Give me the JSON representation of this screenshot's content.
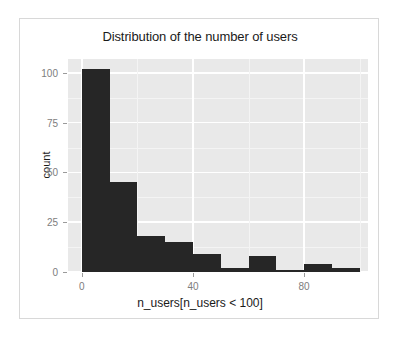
{
  "chart_data": {
    "type": "bar",
    "title": "Distribution of the number of users",
    "xlabel": "n_users[n_users < 100]",
    "ylabel": "count",
    "bin_width": 10,
    "bin_starts": [
      0,
      10,
      20,
      30,
      40,
      50,
      60,
      70,
      80,
      90
    ],
    "categories": [
      "0-10",
      "10-20",
      "20-30",
      "30-40",
      "40-50",
      "50-60",
      "60-70",
      "70-80",
      "80-90",
      "90-100"
    ],
    "values": [
      102,
      45,
      18,
      15,
      9,
      2,
      8,
      1,
      4,
      2
    ],
    "xlim": [
      -5,
      103
    ],
    "ylim": [
      0,
      107
    ],
    "xticks": [
      0,
      40,
      80
    ],
    "xtick_labels": [
      "0",
      "40",
      "80"
    ],
    "yticks": [
      0,
      25,
      50,
      75,
      100
    ],
    "ytick_labels": [
      "0",
      "25",
      "50",
      "75",
      "100"
    ],
    "grid": true,
    "legend": "none",
    "bar_color": "#262626",
    "panel_color": "#e9e9e9",
    "gridline_color": "#ffffff"
  }
}
